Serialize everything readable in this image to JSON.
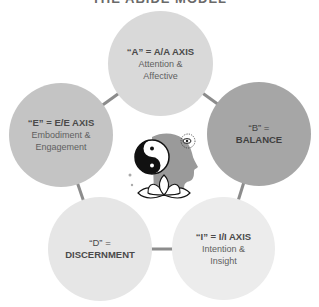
{
  "title": "THE ABIDE MODEL",
  "colors": {
    "connector": "#8c8c8c",
    "circle_a": "#d9d9d9",
    "circle_b": "#a6a6a6",
    "circle_i": "#ececec",
    "circle_d": "#e6e6e6",
    "circle_e": "#c4c4c4"
  },
  "nodes": [
    {
      "id": "A",
      "head": "“A” = A/A AXIS",
      "line1": "Attention &",
      "line2": "Affective"
    },
    {
      "id": "B",
      "head": "“B” =",
      "line1": "BALANCE",
      "line2": ""
    },
    {
      "id": "I",
      "head": "“I” = I/I AXIS",
      "line1": "Intention &",
      "line2": "Insight"
    },
    {
      "id": "D",
      "head": "“D” =",
      "line1": "DISCERNMENT",
      "line2": ""
    },
    {
      "id": "E",
      "head": "“E” = E/E AXIS",
      "line1": "Embodiment &",
      "line2": "Engagement"
    }
  ],
  "center": {
    "icon": "head-yin-yang-lotus-icon"
  }
}
